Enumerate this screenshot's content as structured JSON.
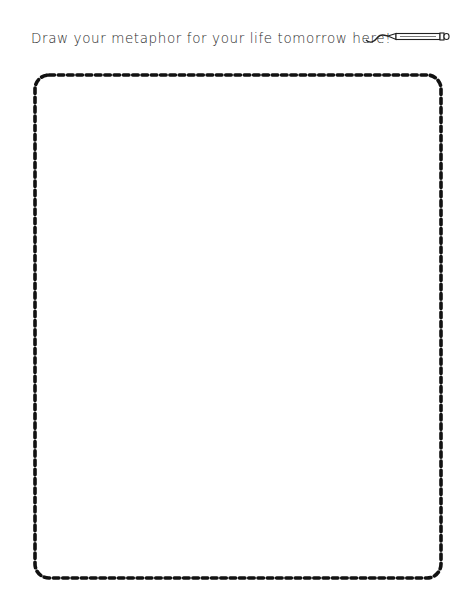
{
  "worksheet": {
    "prompt": "Draw your metaphor for your life tomorrow here!",
    "decoration_icon": "pencil-icon",
    "drawing_area": {
      "border_style": "dashed",
      "border_color": "#111111",
      "background": "#ffffff"
    }
  }
}
